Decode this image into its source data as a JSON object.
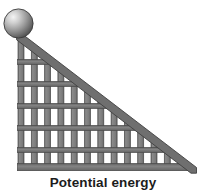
{
  "figure": {
    "title": "Potential energy",
    "caption": "Potential energy",
    "type": "physics-illustration",
    "canvas": {
      "width": 206,
      "height": 195,
      "background": "#ffffff"
    },
    "colors": {
      "bar_fill": "#7d7d7d",
      "bar_edge": "#4a4a4a",
      "crossbar_fill": "#6e6e6e",
      "diagonal_fill": "#6b6b6b",
      "diagonal_edge": "#3f3f3f",
      "ball_highlight": "#f2f2f2",
      "ball_mid": "#9a9a9a",
      "ball_dark": "#4e4e4e",
      "ball_edge": "#3a3a3a",
      "caption_color": "#1c1c1c"
    },
    "ball": {
      "label": "ball",
      "cx": 18.5,
      "cy": 23.5,
      "r": 14.5,
      "highlight_x": 12,
      "highlight_y": 15
    },
    "ramp": {
      "label": "ramp-lattice",
      "apex": {
        "x": 20.0,
        "y": 37.0
      },
      "bottom_left": {
        "x": 20.0,
        "y": 170.0
      },
      "bottom_right": {
        "x": 193.0,
        "y": 170.0
      },
      "bar_width": 6.0,
      "post_spacing": 13.3,
      "post_count": 14,
      "posts_x": [
        18.0,
        31.3,
        44.6,
        57.9,
        71.2,
        84.5,
        97.8,
        111.1,
        124.4,
        137.7,
        151.0,
        164.3,
        177.6,
        187.0
      ],
      "crossbar_height": 5.0,
      "crossbar_count": 6,
      "crossbars_y": [
        60.0,
        82.0,
        104.0,
        126.0,
        148.0,
        164.0
      ],
      "baseline_y": 164.0,
      "baseline_height": 7.0
    },
    "diagonal": {
      "label": "ramp-hypotenuse",
      "x1": 19.0,
      "y1": 37.0,
      "x2": 194.0,
      "y2": 170.0,
      "thickness": 6.5
    }
  }
}
